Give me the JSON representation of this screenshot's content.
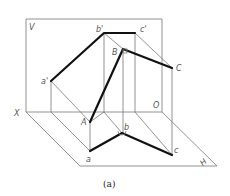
{
  "diagram": {
    "planes": {
      "vertical": "V",
      "horizontal": "H",
      "axis": "X"
    },
    "labels": {
      "b_prime": "b'",
      "c_prime": "c'",
      "a_prime": "a'",
      "B": "B",
      "C": "C",
      "A": "A",
      "a": "a",
      "b": "b",
      "c": "c",
      "O": "O"
    },
    "caption": "(a)"
  }
}
